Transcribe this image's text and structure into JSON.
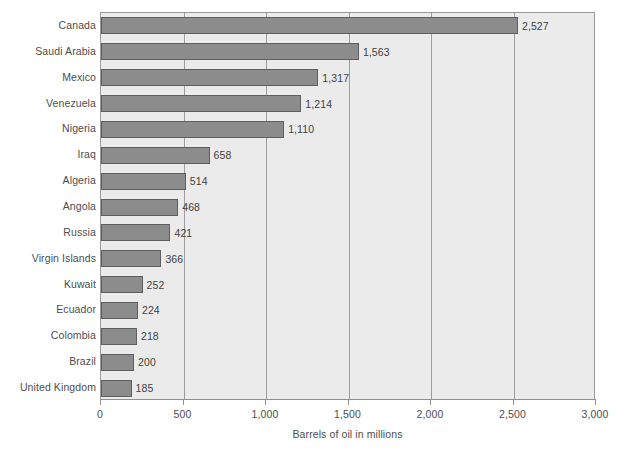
{
  "chart_data": {
    "type": "bar",
    "orientation": "horizontal",
    "title": "",
    "xlabel": "Barrels of oil in millions",
    "ylabel": "",
    "xlim": [
      0,
      3000
    ],
    "xticks": [
      "0",
      "500",
      "1,000",
      "1,500",
      "2,000",
      "2,500",
      "3,000"
    ],
    "xtick_values": [
      0,
      500,
      1000,
      1500,
      2000,
      2500,
      3000
    ],
    "grid": "vertical",
    "legend": "none",
    "categories": [
      "Canada",
      "Saudi Arabia",
      "Mexico",
      "Venezuela",
      "Nigeria",
      "Iraq",
      "Algeria",
      "Angola",
      "Russia",
      "Virgin Islands",
      "Kuwait",
      "Ecuador",
      "Colombia",
      "Brazil",
      "United Kingdom"
    ],
    "values": [
      2527,
      1563,
      1317,
      1214,
      1110,
      658,
      514,
      468,
      421,
      366,
      252,
      224,
      218,
      200,
      185
    ],
    "value_labels": [
      "2,527",
      "1,563",
      "1,317",
      "1,214",
      "1,110",
      "658",
      "514",
      "468",
      "421",
      "366",
      "252",
      "224",
      "218",
      "200",
      "185"
    ]
  },
  "style": {
    "bar_fill": "#8c8c8c",
    "bar_border": "#5e5e5e",
    "plot_background": "#ebebeb",
    "gridline_color": "#9d9d9d",
    "axis_color": "#8f8f8f",
    "text_color": "#4d4d4d",
    "page_background": "#ffffff"
  }
}
